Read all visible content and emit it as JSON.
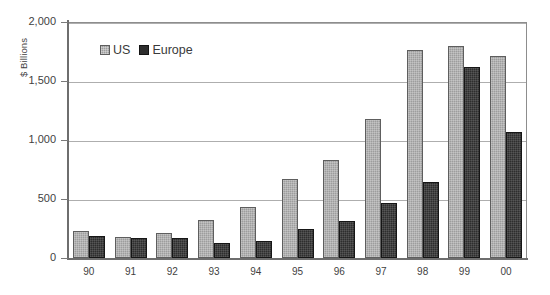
{
  "chart_data": {
    "type": "bar",
    "title": "",
    "subtitle": "",
    "xlabel": "",
    "ylabel": "$ Billions",
    "ylim": [
      0,
      2000
    ],
    "yticks": [
      0,
      500,
      1000,
      1500,
      2000
    ],
    "ytick_labels": [
      "0",
      "500",
      "1,000",
      "1,500",
      "2,000"
    ],
    "grid": true,
    "legend_position": "top-left-inside",
    "categories": [
      "90",
      "91",
      "92",
      "93",
      "94",
      "95",
      "96",
      "97",
      "98",
      "99",
      "00"
    ],
    "series": [
      {
        "name": "US",
        "color": "#9d9d9d",
        "values": [
          230,
          175,
          210,
          320,
          430,
          670,
          830,
          1180,
          1760,
          1800,
          1715
        ]
      },
      {
        "name": "Europe",
        "color": "#2e2e2e",
        "values": [
          190,
          170,
          170,
          130,
          145,
          250,
          310,
          470,
          640,
          1620,
          1065
        ]
      }
    ]
  },
  "legend": {
    "entries": [
      {
        "label": "US",
        "swatch": "us-swatch-icon"
      },
      {
        "label": "Europe",
        "swatch": "europe-swatch-icon"
      }
    ]
  }
}
